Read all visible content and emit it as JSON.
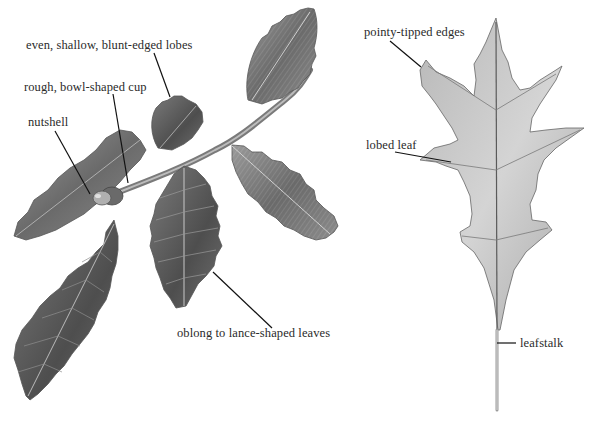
{
  "figure": {
    "left_panel": {
      "subject": "oak branch with acorn",
      "labels": [
        {
          "id": "lobes",
          "text": "even, shallow, blunt-edged lobes"
        },
        {
          "id": "cup",
          "text": "rough, bowl-shaped cup"
        },
        {
          "id": "nutshell",
          "text": "nutshell"
        },
        {
          "id": "leaves",
          "text": "oblong to lance-shaped leaves"
        }
      ]
    },
    "right_panel": {
      "subject": "pointy-lobed oak leaf",
      "labels": [
        {
          "id": "edges",
          "text": "pointy-tipped edges"
        },
        {
          "id": "lobed",
          "text": "lobed leaf"
        },
        {
          "id": "leafstalk",
          "text": "leafstalk"
        }
      ]
    },
    "colors": {
      "background": "#ffffff",
      "text": "#2a2a2a",
      "leaf_dark": "#5a5a5a",
      "leaf_mid": "#8a8a8a",
      "leaf_light": "#c8c8c8",
      "leader_line": "#111111"
    }
  }
}
